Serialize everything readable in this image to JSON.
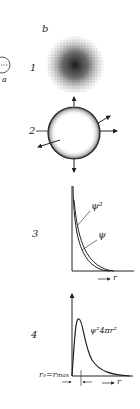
{
  "figure": {
    "panel_label": "b",
    "left_fragment_label": "a",
    "subfigures": [
      {
        "number": "1",
        "description": "electron cloud (probability density shown as dots)"
      },
      {
        "number": "2",
        "description": "sphere boundary surface with outward arrows"
      },
      {
        "number": "3",
        "description": "wavefunction plot",
        "curve_labels": [
          "ψ²",
          "ψ"
        ],
        "x_axis_label": "r"
      },
      {
        "number": "4",
        "description": "radial probability distribution",
        "curve_label": "ψ²4πr²",
        "marker_label": "r₀=r_max",
        "x_axis_label": "r"
      }
    ]
  },
  "labels": {
    "b": "b",
    "a": "a",
    "n1": "1",
    "n2": "2",
    "n3": "3",
    "n4": "4",
    "psi_sq": "ψ²",
    "psi": "ψ",
    "r3": "r",
    "radial": "ψ²4πr²",
    "r0": "r₀=r",
    "rmax_sub": "max",
    "r4": "r"
  },
  "colors": {
    "ink": "#222222",
    "background": "#ffffff"
  }
}
